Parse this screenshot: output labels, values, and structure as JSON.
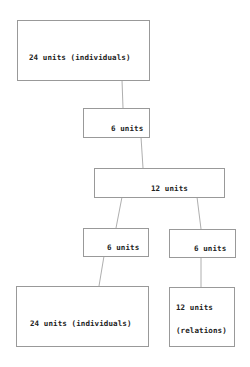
{
  "diagram": {
    "nodes": [
      {
        "id": "top",
        "label": "24 units (individuals)"
      },
      {
        "id": "level2",
        "label": "6 units"
      },
      {
        "id": "level3",
        "label": "12 units"
      },
      {
        "id": "left4",
        "label": "6 units"
      },
      {
        "id": "right4",
        "label": "6 units"
      },
      {
        "id": "bottom_left",
        "label": "24 units (individuals)"
      },
      {
        "id": "bottom_right",
        "label_line1": "12 units",
        "label_line2": "(relations)"
      }
    ],
    "edges": [
      [
        "top",
        "level2"
      ],
      [
        "level2",
        "level3"
      ],
      [
        "level3",
        "left4"
      ],
      [
        "level3",
        "right4"
      ],
      [
        "left4",
        "bottom_left"
      ],
      [
        "right4",
        "bottom_right"
      ]
    ],
    "colors": {
      "border": "#999999",
      "line": "#999999",
      "text": "#222222"
    }
  }
}
